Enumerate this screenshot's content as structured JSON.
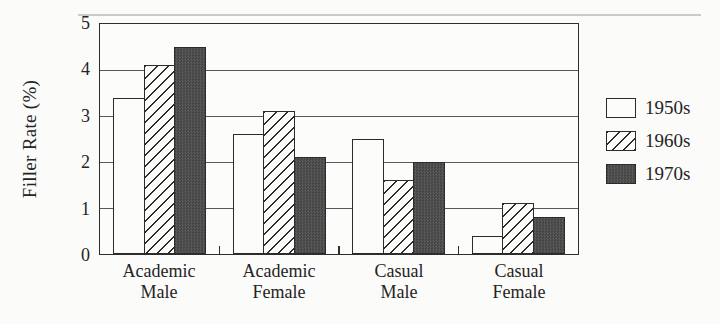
{
  "colors": {
    "ink": "#2b2b2b",
    "gridline": "#585858",
    "bar_dark_fill": "#4e4e4e",
    "background": "#fbfbf9"
  },
  "chart_data": {
    "type": "bar",
    "title": "",
    "xlabel": "",
    "ylabel": "Filler Rate (%)",
    "ylim": [
      0,
      5
    ],
    "yticks": [
      0,
      1,
      2,
      3,
      4,
      5
    ],
    "grid": true,
    "legend_position": "right",
    "categories": [
      "Academic Male",
      "Academic Female",
      "Casual Male",
      "Casual Female"
    ],
    "series": [
      {
        "name": "1950s",
        "fill": "white",
        "values": [
          3.4,
          2.6,
          2.5,
          0.4
        ]
      },
      {
        "name": "1960s",
        "fill": "diagonal-hatch",
        "values": [
          4.1,
          3.1,
          1.6,
          1.1
        ]
      },
      {
        "name": "1970s",
        "fill": "dark-gray",
        "values": [
          4.5,
          2.1,
          2.0,
          0.8
        ]
      }
    ]
  }
}
